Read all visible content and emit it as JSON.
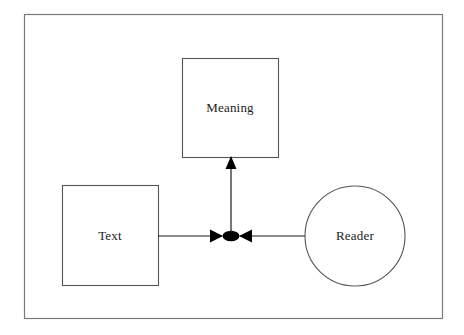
{
  "figure": {
    "type": "node-link-diagram",
    "background_color": "#ffffff",
    "frame": {
      "name": "outer-border",
      "stroke_color": "#7a7a7a",
      "x": 24,
      "y": 14,
      "width": 418,
      "height": 304
    },
    "nodes": [
      {
        "id": "meaning",
        "label": "Meaning",
        "shape": "rectangle",
        "x": 182,
        "y": 58,
        "width": 96,
        "height": 99,
        "stroke_color": "#555555",
        "fill_color": "#ffffff"
      },
      {
        "id": "text",
        "label": "Text",
        "shape": "rectangle",
        "x": 62,
        "y": 185,
        "width": 96,
        "height": 100,
        "stroke_color": "#555555",
        "fill_color": "#ffffff"
      },
      {
        "id": "reader",
        "label": "Reader",
        "shape": "circle",
        "cx": 355,
        "cy": 236,
        "r": 50,
        "stroke_color": "#555555",
        "fill_color": "#ffffff"
      }
    ],
    "junction": {
      "id": "transaction-node",
      "shape": "filled-ellipse",
      "cx": 231,
      "cy": 236,
      "rx": 8,
      "ry": 5,
      "fill_color": "#000000"
    },
    "edges": [
      {
        "id": "text-to-junction",
        "from": "text",
        "to": "transaction-node",
        "orientation": "horizontal",
        "x1": 158,
        "y1": 236,
        "x2": 231,
        "y2": 236,
        "arrowhead": "at-junction-pointing-right",
        "stroke_color": "#1b1b1b"
      },
      {
        "id": "reader-to-junction",
        "from": "reader",
        "to": "transaction-node",
        "orientation": "horizontal",
        "x1": 305,
        "y1": 236,
        "x2": 231,
        "y2": 236,
        "arrowhead": "at-junction-pointing-left",
        "stroke_color": "#1b1b1b"
      },
      {
        "id": "junction-to-meaning",
        "from": "transaction-node",
        "to": "meaning",
        "orientation": "vertical",
        "x1": 231,
        "y1": 236,
        "x2": 231,
        "y2": 157,
        "arrowhead": "at-meaning-pointing-up",
        "stroke_color": "#1b1b1b"
      }
    ]
  }
}
